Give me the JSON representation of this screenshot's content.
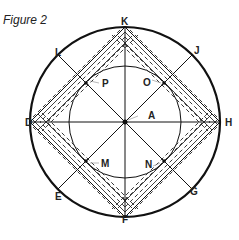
{
  "figure": {
    "title": "Figure 2",
    "center_label": "A",
    "outer_points": [
      {
        "id": "K",
        "label": "K",
        "angle_deg": 90
      },
      {
        "id": "J",
        "label": "J",
        "angle_deg": 45
      },
      {
        "id": "H",
        "label": "H",
        "angle_deg": 0
      },
      {
        "id": "G",
        "label": "G",
        "angle_deg": -45
      },
      {
        "id": "F",
        "label": "F",
        "angle_deg": -90
      },
      {
        "id": "E",
        "label": "E",
        "angle_deg": -135
      },
      {
        "id": "D",
        "label": "D",
        "angle_deg": 180
      },
      {
        "id": "L",
        "label": "L",
        "angle_deg": 135
      }
    ],
    "inner_points": [
      {
        "id": "O",
        "label": "O"
      },
      {
        "id": "P",
        "label": "P"
      },
      {
        "id": "M",
        "label": "M"
      },
      {
        "id": "N",
        "label": "N"
      }
    ],
    "colors": {
      "stroke": "#111111",
      "text": "#222222",
      "background": "#ffffff"
    }
  }
}
